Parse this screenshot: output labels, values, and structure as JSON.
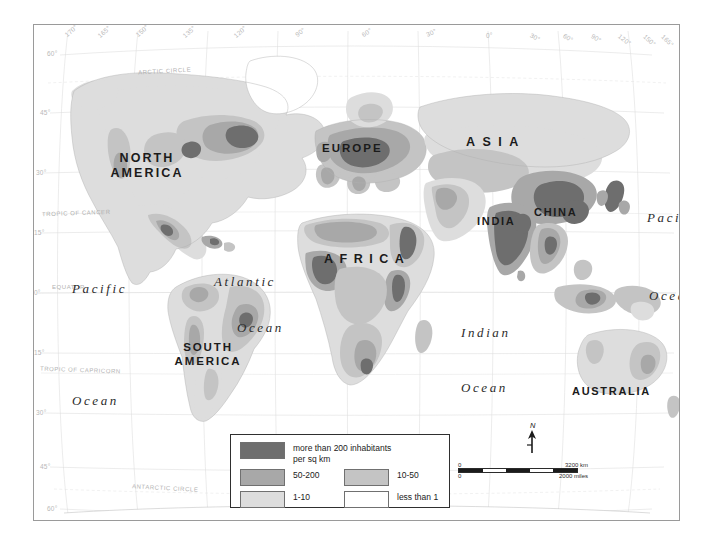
{
  "map": {
    "title": "World Population Density",
    "continents": [
      {
        "name": "north-america",
        "label": "NORTH\nAMERICA",
        "line1": "NORTH",
        "line2": "AMERICA"
      },
      {
        "name": "south-america",
        "label": "SOUTH\nAMERICA",
        "line1": "SOUTH",
        "line2": "AMERICA"
      },
      {
        "name": "europe",
        "label": "EUROPE"
      },
      {
        "name": "asia",
        "label": "ASIA"
      },
      {
        "name": "africa",
        "label": "AFRICA"
      },
      {
        "name": "india",
        "label": "INDIA"
      },
      {
        "name": "china",
        "label": "CHINA"
      },
      {
        "name": "australia",
        "label": "AUSTRALIA"
      }
    ],
    "oceans": [
      {
        "name": "pacific-west",
        "line1": "Pacific",
        "line2": "Ocean"
      },
      {
        "name": "atlantic",
        "line1": "Atlantic",
        "line2": "Ocean"
      },
      {
        "name": "indian",
        "line1": "Indian",
        "line2": "Ocean"
      },
      {
        "name": "pacific-east",
        "line1": "Pacific",
        "line2": "Ocean"
      }
    ],
    "latitudes": [
      "60°",
      "45°",
      "30°",
      "15°",
      "0°",
      "15°",
      "30°",
      "45°",
      "60°"
    ],
    "longitudes_left": [
      "170°",
      "165°",
      "150°",
      "135°",
      "120°",
      "90°",
      "60°",
      "30°",
      "0°"
    ],
    "longitudes_right": [
      "30°",
      "60°",
      "90°",
      "120°",
      "150°",
      "165°",
      "170°"
    ],
    "special_lines": [
      {
        "name": "arctic-circle",
        "label": "ARCTIC CIRCLE"
      },
      {
        "name": "tropic-of-cancer",
        "label": "TROPIC OF CANCER"
      },
      {
        "name": "equator",
        "label": "EQUATOR"
      },
      {
        "name": "tropic-of-capricorn",
        "label": "TROPIC OF CAPRICORN"
      },
      {
        "name": "antarctic-circle",
        "label": "ANTARCTIC CIRCLE"
      }
    ]
  },
  "legend": {
    "entries": [
      {
        "key": "over-200",
        "label_line1": "more than 200 inhabitants",
        "label_line2": "per sq km",
        "color": "#6e6e6e"
      },
      {
        "key": "50-200",
        "label_line1": "50-200",
        "label_line2": "",
        "color": "#a8a8a8"
      },
      {
        "key": "10-50",
        "label_line1": "10-50",
        "label_line2": "",
        "color": "#c4c4c4"
      },
      {
        "key": "1-10",
        "label_line1": "1-10",
        "label_line2": "",
        "color": "#dddddd"
      },
      {
        "key": "less-than-1",
        "label_line1": "less than 1",
        "label_line2": "",
        "color": "#ffffff"
      }
    ]
  },
  "scale": {
    "km_zero": "0",
    "km_max": "3200 km",
    "miles_zero": "0",
    "miles_max": "2000 miles"
  },
  "compass": {
    "north_label": "N"
  }
}
